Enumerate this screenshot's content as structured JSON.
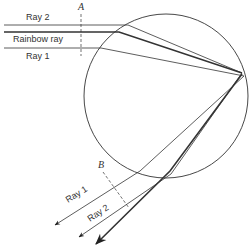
{
  "diagram": {
    "type": "raindrop-rainbow-ray-diagram",
    "labels": {
      "ray2_in": "Ray 2",
      "rainbow_ray": "Rainbow ray",
      "ray1_in": "Ray 1",
      "wavefront_a": "A",
      "wavefront_b": "B",
      "ray1_out": "Ray 1",
      "ray2_out": "Ray 2"
    },
    "colors": {
      "line": "#222222",
      "background": "#ffffff"
    },
    "droplet": {
      "cx": 166,
      "cy": 96,
      "r": 82
    }
  }
}
